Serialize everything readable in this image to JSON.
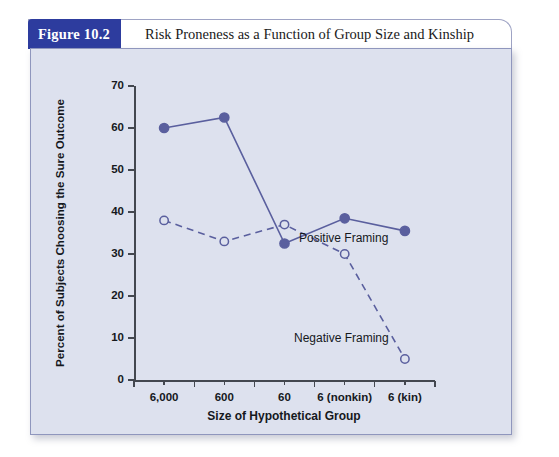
{
  "figure": {
    "badge": "Figure 10.2",
    "title": "Risk Proneness as a Function of Group Size and Kinship"
  },
  "chart_data": {
    "type": "line",
    "title": "Risk Proneness as a Function of Group Size and Kinship",
    "xlabel": "Size of Hypothetical Group",
    "ylabel": "Percent of Subjects Choosing the Sure Outcome",
    "categories": [
      "6,000",
      "600",
      "60",
      "6 (nonkin)",
      "6 (kin)"
    ],
    "ylim": [
      0,
      70
    ],
    "yticks": [
      0,
      10,
      20,
      30,
      40,
      50,
      60,
      70
    ],
    "grid": false,
    "legend_position": "inline-annotation",
    "series": [
      {
        "name": "Positive Framing",
        "values": [
          60,
          62.5,
          32.5,
          38.5,
          35.5
        ],
        "style": "solid",
        "marker": "filled-circle",
        "color": "#5a5f9e"
      },
      {
        "name": "Negative Framing",
        "values": [
          38,
          33,
          37,
          30,
          5
        ],
        "style": "dashed",
        "marker": "open-circle",
        "color": "#5a5f9e"
      }
    ],
    "annotations": [
      {
        "text": "Positive Framing",
        "near_series": "Positive Framing"
      },
      {
        "text": "Negative Framing",
        "near_series": "Negative Framing"
      }
    ]
  },
  "colors": {
    "badge_bg": "#2d3c9e",
    "panel_bg": "#dde1ee",
    "series": "#5a5f9e",
    "axis": "#43474f"
  }
}
